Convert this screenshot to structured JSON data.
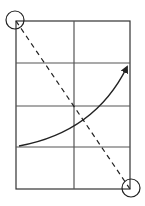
{
  "diagram": {
    "colors": {
      "line": "#222222",
      "background": "#ffffff"
    },
    "grid": {
      "x0": 16,
      "y0": 21,
      "x1": 130,
      "y1": 189,
      "columns": 2,
      "rows": 4,
      "mid_x": 74,
      "row_lines_y": [
        63,
        106,
        147
      ]
    },
    "diagonal": {
      "from": [
        16,
        21
      ],
      "to": [
        130,
        189
      ],
      "style": "dashed"
    },
    "corner_circles": [
      {
        "name": "top-left",
        "cx": 15,
        "cy": 20,
        "r": 9
      },
      {
        "name": "bottom-right",
        "cx": 131,
        "cy": 188,
        "r": 9
      }
    ],
    "curve_arrow": {
      "start": [
        19,
        146
      ],
      "control": [
        90,
        130
      ],
      "end": [
        128,
        66
      ]
    }
  }
}
